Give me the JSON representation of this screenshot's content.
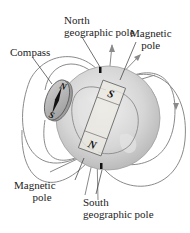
{
  "figure": {
    "labels": {
      "north_geographic_pole": [
        "North",
        "geographic pole"
      ],
      "magnetic_pole_top": [
        "Magnetic",
        "pole"
      ],
      "compass": "Compass",
      "magnetic_pole_bottom": [
        "Magnetic",
        "pole"
      ],
      "south_geographic_pole": [
        "South",
        "geographic pole"
      ]
    },
    "bar_magnet": {
      "top_pole": "S",
      "bottom_pole": "N"
    },
    "compass_needle": {
      "top": "N",
      "bottom": "S"
    },
    "colors": {
      "field_lines": "#8a8a8a",
      "earth": "#d4d4d4",
      "magnet_fill": "#e8e6e0",
      "compass_fill": "#b8b8b8",
      "text": "#222222"
    }
  }
}
